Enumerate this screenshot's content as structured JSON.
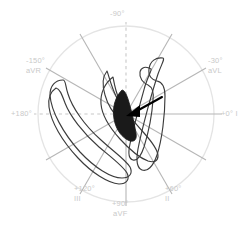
{
  "figure": {
    "name": "hexaxial-reference-vectorcardiogram",
    "background_color": "#ffffff",
    "center": {
      "x": 126,
      "y": 114
    },
    "radius": 88,
    "circle_color": "#e4e4e4",
    "axis_color": "#b6b6b6",
    "dashed_axis_color": "#c6c6c6",
    "label_color": "#c9c9c9",
    "loop_color": "#3c3c3c",
    "qrs_fill_color": "#1a1a1a",
    "arrow_color": "#000000"
  },
  "axes": [
    {
      "id": "lead-minus-90",
      "degrees": "-90°",
      "lead": "",
      "angle": -90,
      "style": "dashed",
      "label_left": 110,
      "label_top": 9,
      "align": "center"
    },
    {
      "id": "lead-avr",
      "degrees": "-150°",
      "lead": "aVR",
      "angle": -150,
      "style": "solid",
      "label_left": 26,
      "label_top": 56,
      "align": "left"
    },
    {
      "id": "lead-avl",
      "degrees": "-30°",
      "lead": "aVL",
      "angle": -30,
      "style": "solid",
      "label_left": 208,
      "label_top": 56,
      "align": "left"
    },
    {
      "id": "lead-180",
      "degrees": "+180°",
      "lead": "",
      "angle": 180,
      "style": "dashed",
      "label_left": 11,
      "label_top": 109,
      "align": "left"
    },
    {
      "id": "lead-i",
      "degrees": "+0° I",
      "lead": "",
      "angle": 0,
      "style": "solid",
      "label_left": 221,
      "label_top": 109,
      "align": "left"
    },
    {
      "id": "lead-iii",
      "degrees": "+120°",
      "lead": "III",
      "angle": 120,
      "style": "solid",
      "label_left": 74,
      "label_top": 184,
      "align": "left"
    },
    {
      "id": "lead-ii",
      "degrees": "+60°",
      "lead": "II",
      "angle": 60,
      "style": "solid",
      "label_left": 165,
      "label_top": 184,
      "align": "left"
    },
    {
      "id": "lead-avf",
      "degrees": "+90°",
      "lead": "aVF",
      "angle": 90,
      "style": "solid",
      "label_left": 112,
      "label_top": 199,
      "align": "center"
    }
  ],
  "loops": {
    "p_loop_label": "P loop",
    "qrs_loop_label": "QRS loop",
    "t_loop_label": "T loop",
    "mean_axis_arrow_label": "mean electrical axis arrow"
  }
}
